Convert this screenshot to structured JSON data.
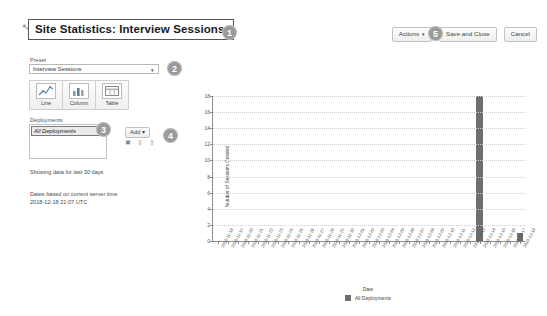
{
  "header": {
    "title": "Site Statistics: Interview Sessions",
    "resize_handle": "↖"
  },
  "toolbar": {
    "actions_label": "Actions",
    "actions_caret": "▾",
    "save_label": "Save and Close",
    "cancel_label": "Cancel"
  },
  "sidebar": {
    "preset_label": "Preset",
    "preset_value": "Interview Sessions",
    "preset_caret": "▾",
    "chart_types": [
      {
        "name": "line",
        "label": "Line"
      },
      {
        "name": "column",
        "label": "Column"
      },
      {
        "name": "table",
        "label": "Table"
      }
    ],
    "deployments_label": "Deployments",
    "deployments_items": [
      "All Deployments"
    ],
    "add_label": "Add",
    "add_caret": "▾",
    "row_icons": [
      {
        "name": "delete-icon",
        "glyph": "✖"
      },
      {
        "name": "move-down-icon",
        "glyph": "⇩"
      },
      {
        "name": "move-up-icon",
        "glyph": "⇧"
      }
    ],
    "note_range": "Showing data for last 30 days",
    "note_server_line1": "Dates based on current server time",
    "note_server_line2": "2018-12-18 21:07 UTC"
  },
  "badges": [
    {
      "id": "1",
      "label": "1"
    },
    {
      "id": "2",
      "label": "2"
    },
    {
      "id": "3",
      "label": "3"
    },
    {
      "id": "4",
      "label": "4"
    },
    {
      "id": "5",
      "label": "5"
    }
  ],
  "chart_data": {
    "type": "bar",
    "title": "",
    "xlabel": "Date",
    "ylabel": "Number of Sessions Created",
    "ylim": [
      0,
      18
    ],
    "yticks": [
      0,
      2,
      4,
      6,
      8,
      10,
      12,
      14,
      16,
      18
    ],
    "grid": true,
    "legend": [
      {
        "name": "All Deployments",
        "color": "#6e6e6e"
      }
    ],
    "legend_position": "bottom",
    "bar_color": "#6e6e6e",
    "categories": [
      "2018-11-18",
      "2018-11-19",
      "2018-11-20",
      "2018-11-21",
      "2018-11-22",
      "2018-11-23",
      "2018-11-24",
      "2018-11-25",
      "2018-11-26",
      "2018-11-27",
      "2018-11-28",
      "2018-11-29",
      "2018-11-30",
      "2018-12-01",
      "2018-12-02",
      "2018-12-03",
      "2018-12-04",
      "2018-12-05",
      "2018-12-06",
      "2018-12-07",
      "2018-12-08",
      "2018-12-09",
      "2018-12-10",
      "2018-12-11",
      "2018-12-12",
      "2018-12-13",
      "2018-12-14",
      "2018-12-15",
      "2018-12-16",
      "2018-12-17",
      "2018-12-18"
    ],
    "values": [
      0,
      0,
      0,
      0,
      0,
      0,
      0,
      0,
      0,
      0,
      0,
      0,
      0,
      0,
      0,
      0,
      0,
      0,
      0,
      0,
      0,
      0,
      0,
      0,
      0,
      0,
      18,
      0,
      0,
      0,
      1
    ]
  }
}
